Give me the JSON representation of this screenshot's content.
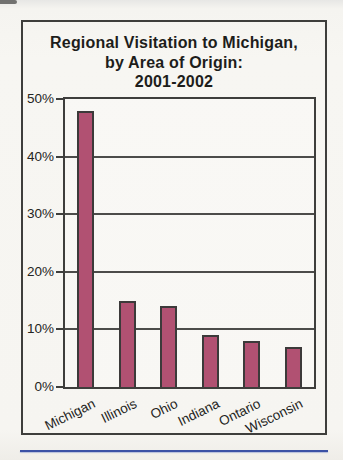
{
  "page": {
    "background_color": "#f6f5f1"
  },
  "chart_data": {
    "type": "bar",
    "title": "Regional Visitation to Michigan, by Area of Origin: 2001-2002",
    "title_lines": [
      "Regional Visitation to Michigan,",
      "by Area of Origin:",
      "2001-2002"
    ],
    "categories": [
      "Michigan",
      "Illinois",
      "Ohio",
      "Indiana",
      "Ontario",
      "Wisconsin"
    ],
    "values": [
      48,
      15,
      14,
      9,
      8,
      7
    ],
    "y_ticks": [
      0,
      10,
      20,
      30,
      40,
      50
    ],
    "y_tick_labels": [
      "0%",
      "10%",
      "20%",
      "30%",
      "40%",
      "50%"
    ],
    "ylim": [
      0,
      50
    ],
    "xlabel": "",
    "ylabel": "",
    "grid": "horizontal",
    "legend": "none",
    "bar_color": "#b15172",
    "bar_border_color": "#3c3a3a",
    "axis_color": "#3e3e3c"
  },
  "decorations": {
    "bottom_rule_color": "#3b51a5"
  }
}
